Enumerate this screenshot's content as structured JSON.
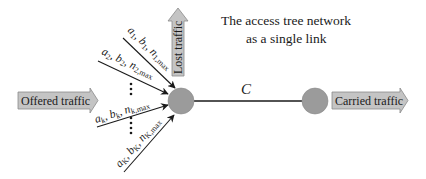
{
  "title": {
    "line1": "The access tree network",
    "line2": "as a single link"
  },
  "arrows": {
    "offered": "Offered traffic",
    "carried": "Carried traffic",
    "lost": "Lost traffic"
  },
  "link": {
    "label": "C"
  },
  "sources": [
    {
      "a": "a",
      "b": "b",
      "n": "n",
      "sub": "1",
      "max": "max"
    },
    {
      "a": "a",
      "b": "b",
      "n": "n",
      "sub": "2",
      "max": "max"
    },
    {
      "a": "a",
      "b": "b",
      "n": "n",
      "sub": "k",
      "max": "max"
    },
    {
      "a": "a",
      "b": "b",
      "n": "n",
      "sub": "K",
      "max": "max"
    }
  ],
  "colors": {
    "node_fill": "#9b9b9b",
    "arrow_fill": "#c4c4c4",
    "line": "#1a1a1a"
  }
}
